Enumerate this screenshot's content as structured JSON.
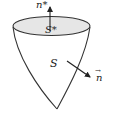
{
  "diagram": {
    "labels": {
      "top_normal": "n*",
      "top_surface": "S*",
      "lateral_surface": "S",
      "lateral_normal": "n",
      "lateral_normal_vector_mark": "→"
    },
    "colors": {
      "stroke": "#333333",
      "disc_fill": "#e6e6e6",
      "background": "#ffffff"
    }
  }
}
